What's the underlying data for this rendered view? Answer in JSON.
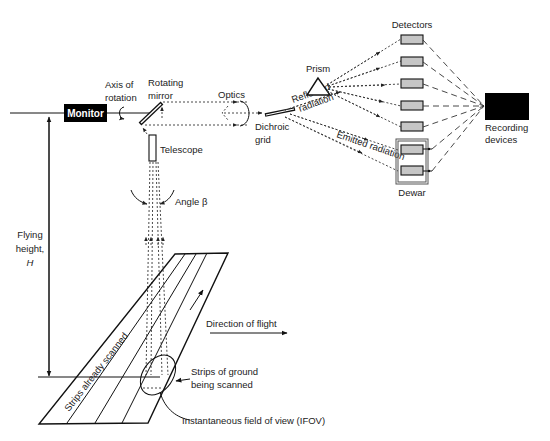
{
  "diagram": {
    "labels": {
      "monitor": "Monitor",
      "axis_line1": "Axis of",
      "axis_line2": "rotation",
      "mirror_line1": "Rotating",
      "mirror_line2": "mirror",
      "optics": "Optics",
      "telescope": "Telescope",
      "angle": "Angle β",
      "dichroic_line1": "Dichroic",
      "dichroic_line2": "grid",
      "reflected_line1": "Reflected",
      "reflected_line2": "radiation",
      "emitted": "Emitted radiation",
      "prism": "Prism",
      "detectors": "Detectors",
      "dewar": "Dewar",
      "recording_line1": "Recording",
      "recording_line2": "devices",
      "flying_line1": "Flying",
      "flying_line2": "height,",
      "flying_line3": "H",
      "direction": "Direction of flight",
      "strips_scanned": "Strips already scanned",
      "strips_ground_line1": "Strips of ground",
      "strips_ground_line2": "being scanned",
      "ifov": "Instantaneous field of view (IFOV)"
    },
    "detectors_count": 5,
    "dewar_detectors_count": 2,
    "colors": {
      "line": "#111111",
      "detector_fill": "#c6c6c6",
      "block_fill": "#000000",
      "background": "#ffffff"
    }
  }
}
